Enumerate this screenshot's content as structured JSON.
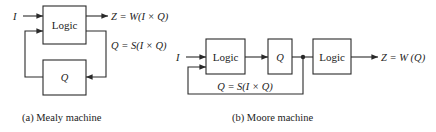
{
  "mealy": {
    "input_label": "I",
    "logic_label": "Logic",
    "state_label": "Q",
    "output_eq": "Z = W(I × Q)",
    "state_eq": "Q = S(I × Q)",
    "caption": "(a)  Mealy machine"
  },
  "moore": {
    "input_label": "I",
    "logic1_label": "Logic",
    "state_label": "Q",
    "logic2_label": "Logic",
    "output_eq": "Z = W (Q)",
    "state_eq": "Q = S(I × Q)",
    "caption": "(b)  Moore machine"
  },
  "colors": {
    "line": "#2a2a2a",
    "text": "#222222",
    "background": "#ffffff"
  }
}
